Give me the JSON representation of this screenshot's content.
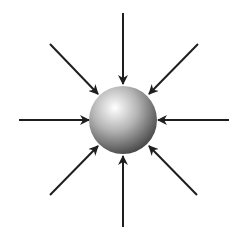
{
  "diagram": {
    "background": "#ffffff",
    "sphere": {
      "cx": 123,
      "cy": 120,
      "r": 34,
      "highlight_color": "#ffffff",
      "mid_color": "#b4b4b4",
      "shadow_color": "#3c3c3c"
    },
    "arrow_color": "#1e1e1e",
    "arrow_width": 2,
    "arrows": [
      {
        "name": "top",
        "x1": 123,
        "y1": 13,
        "x2": 123,
        "y2": 84
      },
      {
        "name": "top-right",
        "x1": 198,
        "y1": 44,
        "x2": 149,
        "y2": 94
      },
      {
        "name": "right",
        "x1": 229,
        "y1": 120,
        "x2": 158,
        "y2": 120
      },
      {
        "name": "bottom-right",
        "x1": 197,
        "y1": 195,
        "x2": 149,
        "y2": 146
      },
      {
        "name": "bottom",
        "x1": 123,
        "y1": 227,
        "x2": 123,
        "y2": 156
      },
      {
        "name": "bottom-left",
        "x1": 50,
        "y1": 195,
        "x2": 98,
        "y2": 146
      },
      {
        "name": "left",
        "x1": 19,
        "y1": 120,
        "x2": 89,
        "y2": 120
      },
      {
        "name": "top-left",
        "x1": 50,
        "y1": 44,
        "x2": 98,
        "y2": 94
      }
    ]
  }
}
